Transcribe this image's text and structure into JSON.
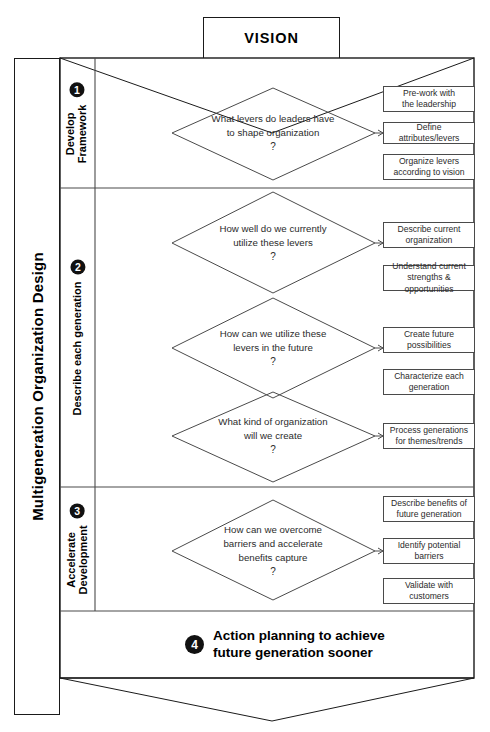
{
  "header": {
    "vision_label": "VISION"
  },
  "title": {
    "main": "Multigeneration Organization Design"
  },
  "phases": [
    {
      "number": "1",
      "label_line1": "Develop",
      "label_line2": "Framework"
    },
    {
      "number": "2",
      "label_line1": "Describe each generation",
      "label_line2": ""
    },
    {
      "number": "3",
      "label_line1": "Accelerate",
      "label_line2": "Development"
    }
  ],
  "questions": [
    {
      "line1": "What levers do leaders have",
      "line2": "to shape organization",
      "mark": "?"
    },
    {
      "line1": "How well do we currently",
      "line2": "utilize these levers",
      "mark": "?"
    },
    {
      "line1": "How can we utilize these",
      "line2": "levers in the future",
      "mark": "?"
    },
    {
      "line1": "What kind of organization",
      "line2": "will we create",
      "mark": "?"
    },
    {
      "line1": "How can we overcome",
      "line2": "barriers and accelerate",
      "line3": "benefits capture",
      "mark": "?"
    }
  ],
  "actions": [
    {
      "line1": "Pre-work with",
      "line2": "the leadership"
    },
    {
      "line1": "Define attributes/levers",
      "line2": ""
    },
    {
      "line1": "Organize levers",
      "line2": "according to vision"
    },
    {
      "line1": "Describe current",
      "line2": "organization"
    },
    {
      "line1": "Understand current",
      "line2": "strengths & opportunities"
    },
    {
      "line1": "Create future",
      "line2": "possibilities"
    },
    {
      "line1": "Characterize each",
      "line2": "generation"
    },
    {
      "line1": "Process generations",
      "line2": "for themes/trends"
    },
    {
      "line1": "Describe benefits of",
      "line2": "future generation"
    },
    {
      "line1": "Identify potential",
      "line2": "barriers"
    },
    {
      "line1": "Validate with",
      "line2": "customers"
    }
  ],
  "step4": {
    "number": "4",
    "line1": "Action planning to achieve",
    "line2": "future generation sooner"
  },
  "colors": {
    "stroke": "#1a1a1a",
    "thin_stroke": "#4a4a4a",
    "badge": "#111111",
    "text": "#2b2b2b"
  }
}
